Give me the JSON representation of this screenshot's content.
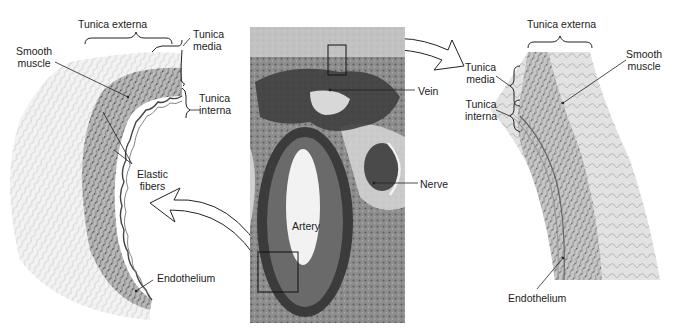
{
  "figure": {
    "left_panel": {
      "title": "Artery wall detail",
      "labels": {
        "tunica_externa": "Tunica externa",
        "tunica_media_line1": "Tunica",
        "tunica_media_line2": "media",
        "tunica_interna_line1": "Tunica",
        "tunica_interna_line2": "interna",
        "smooth_muscle_line1": "Smooth",
        "smooth_muscle_line2": "muscle",
        "elastic_fibers_line1": "Elastic",
        "elastic_fibers_line2": "fibers",
        "endothelium": "Endothelium"
      }
    },
    "center_panel": {
      "title": "Micrograph cross-section",
      "labels": {
        "vein": "Vein",
        "artery": "Artery",
        "nerve": "Nerve"
      }
    },
    "right_panel": {
      "title": "Vein wall detail",
      "labels": {
        "tunica_externa": "Tunica externa",
        "tunica_media_line1": "Tunica",
        "tunica_media_line2": "media",
        "tunica_interna_line1": "Tunica",
        "tunica_interna_line2": "interna",
        "smooth_muscle_line1": "Smooth",
        "smooth_muscle_line2": "muscle",
        "endothelium": "Endothelium"
      }
    },
    "colors": {
      "tissue_light": "#e6e6e6",
      "tissue_mid": "#b5b5b5",
      "tissue_dark": "#555555",
      "photo_dark": "#3f3f3f",
      "line": "#222222"
    }
  }
}
